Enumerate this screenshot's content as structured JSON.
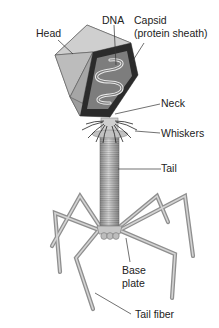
{
  "diagram": {
    "labels": {
      "head": "Head",
      "dna": "DNA",
      "capsid_line1": "Capsid",
      "capsid_line2": "(protein sheath)",
      "neck": "Neck",
      "whiskers": "Whiskers",
      "tail": "Tail",
      "base_line1": "Base",
      "base_line2": "plate",
      "tail_fiber": "Tail fiber"
    },
    "colors": {
      "capsid_dark": "#2b2b2b",
      "face_light": "#c9c9c9",
      "face_mid": "#a8a8a8",
      "face_dark": "#8a8a8a",
      "dna_inner": "#7d7d7d",
      "dna_strand": "#e6e6e6",
      "tail": "#b5b5b5",
      "leader_line": "#333333"
    }
  }
}
